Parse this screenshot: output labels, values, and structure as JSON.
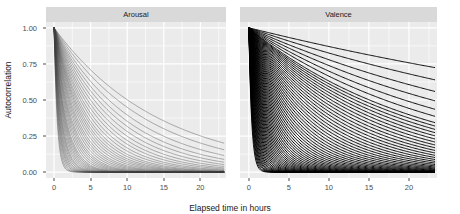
{
  "figure": {
    "ylabel": "Autocorrelation",
    "xlabel": "Elapsed time in hours",
    "panels": [
      {
        "name": "arousal-panel",
        "title": "Arousal"
      },
      {
        "name": "valence-panel",
        "title": "Valence"
      }
    ]
  },
  "chart_data": {
    "type": "line",
    "title": "",
    "subtitle": "",
    "xlabel": "Elapsed time in hours",
    "ylabel": "Autocorrelation",
    "xlim": [
      -1.1,
      23.5
    ],
    "ylim": [
      -0.04,
      1.04
    ],
    "xticks": [
      0,
      5,
      10,
      15,
      20
    ],
    "yticks": [
      0.0,
      0.25,
      0.5,
      0.75,
      1.0
    ],
    "ytick_labels": [
      "0.00",
      "0.25",
      "0.50",
      "0.75",
      "1.00"
    ],
    "xtick_labels": [
      "0",
      "5",
      "10",
      "15",
      "20"
    ],
    "grid": true,
    "grid_color": "#ffffff",
    "panel_background": "#ebebeb",
    "legend": "none",
    "facets": [
      "Arousal",
      "Valence"
    ],
    "model": "exponential decay: y = exp(-t / tau)",
    "panel_series": [
      {
        "facet": "Arousal",
        "line_color": "#3d3d3d",
        "line_opacity": 0.45,
        "line_width": 0.9,
        "n_curves": 42,
        "taus": [
          0.42,
          0.48,
          0.55,
          0.62,
          0.68,
          0.75,
          0.82,
          0.9,
          0.98,
          1.05,
          1.15,
          1.25,
          1.35,
          1.45,
          1.55,
          1.65,
          1.8,
          1.95,
          2.1,
          2.25,
          2.4,
          2.6,
          2.8,
          3.0,
          3.2,
          3.45,
          3.7,
          3.95,
          4.2,
          4.5,
          4.8,
          5.2,
          5.6,
          6.1,
          6.6,
          7.2,
          7.9,
          8.7,
          9.6,
          10.8,
          12.5,
          14.5
        ]
      },
      {
        "facet": "Valence",
        "line_color": "#000000",
        "line_opacity": 0.95,
        "line_width": 1.0,
        "n_curves": 66,
        "taus": [
          0.35,
          0.4,
          0.45,
          0.5,
          0.55,
          0.6,
          0.66,
          0.72,
          0.78,
          0.85,
          0.92,
          1.0,
          1.08,
          1.16,
          1.25,
          1.34,
          1.44,
          1.54,
          1.65,
          1.76,
          1.88,
          2.0,
          2.13,
          2.27,
          2.42,
          2.58,
          2.75,
          2.93,
          3.12,
          3.32,
          3.53,
          3.76,
          4.0,
          4.26,
          4.53,
          4.82,
          5.13,
          5.46,
          5.81,
          6.18,
          6.58,
          7.0,
          7.45,
          7.93,
          8.44,
          8.98,
          9.56,
          10.18,
          10.84,
          11.54,
          12.29,
          13.09,
          13.94,
          14.85,
          15.82,
          16.85,
          17.95,
          19.13,
          20.39,
          21.74,
          24.5,
          28.0,
          33.0,
          40.0,
          52.0,
          72.0
        ]
      }
    ]
  }
}
